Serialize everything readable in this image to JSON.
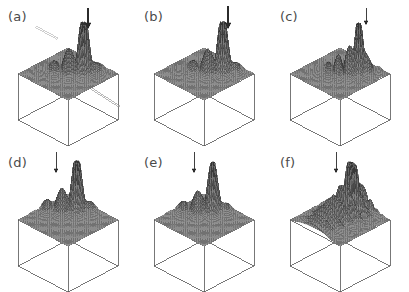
{
  "figure": {
    "type": "multi-panel-3d-surface-figure",
    "panel_count": 6,
    "grid_rows": 2,
    "grid_cols": 3,
    "background_color": "#ffffff",
    "surface_fill_color": "#7a7a7a",
    "surface_line_color": "#3a3a3a",
    "box_line_color": "#555555",
    "label_color": "#4a4a4a",
    "arrow_color": "#2b2b2b",
    "projection": "isometric",
    "base_shape": "diamond-square"
  },
  "panels": [
    {
      "id": "a",
      "label": "(a)",
      "arrow": {
        "present": true,
        "x": 88,
        "y": 8,
        "length": 20,
        "weight": "bold",
        "points": "down"
      },
      "extra_annotations": [
        {
          "name": "upper-left-pointer",
          "style": "thin-double-line",
          "color": "#b9b9b9",
          "x1": 36,
          "y1": 26,
          "x2": 58,
          "y2": 38
        },
        {
          "name": "lower-right-pointer",
          "style": "thin-double-line",
          "color": "#9a9a9a",
          "x1": 92,
          "y1": 88,
          "x2": 120,
          "y2": 106
        }
      ],
      "peak_height": 0.95,
      "peak_u": 0.62,
      "peak_v": 0.3,
      "ridge_orientation": "diagonal",
      "lobe_count": 2,
      "description": "tall narrow spike at rear with broad oscillatory lobe extending forward-left"
    },
    {
      "id": "b",
      "label": "(b)",
      "arrow": {
        "present": true,
        "x": 92,
        "y": 6,
        "length": 22,
        "weight": "bold",
        "points": "down"
      },
      "extra_annotations": [],
      "peak_height": 0.92,
      "peak_u": 0.64,
      "peak_v": 0.26,
      "ridge_orientation": "diagonal",
      "lobe_count": 2,
      "description": "narrow spike at rear, single elongated ridge sloping to front-left"
    },
    {
      "id": "c",
      "label": "(c)",
      "arrow": {
        "present": true,
        "x": 94,
        "y": 8,
        "length": 16,
        "weight": "thin",
        "points": "down"
      },
      "extra_annotations": [],
      "peak_height": 0.88,
      "peak_u": 0.66,
      "peak_v": 0.28,
      "ridge_orientation": "diagonal",
      "lobe_count": 3,
      "description": "broader crest with several concentric oscillation bands spreading left"
    },
    {
      "id": "d",
      "label": "(d)",
      "arrow": {
        "present": true,
        "x": 56,
        "y": 6,
        "length": 20,
        "weight": "thin",
        "points": "down"
      },
      "extra_annotations": [],
      "peak_height": 0.9,
      "peak_u": 0.4,
      "peak_v": 0.22,
      "ridge_orientation": "diagonal",
      "lobe_count": 2,
      "description": "spike shifted to the left edge with ridge trailing toward front-centre"
    },
    {
      "id": "e",
      "label": "(e)",
      "arrow": {
        "present": true,
        "x": 58,
        "y": 6,
        "length": 20,
        "weight": "thin",
        "points": "down"
      },
      "extra_annotations": [],
      "peak_height": 0.82,
      "peak_u": 0.42,
      "peak_v": 0.24,
      "ridge_orientation": "diagonal",
      "lobe_count": 2,
      "description": "slimmer spike on the left with compact ridge running to the front"
    },
    {
      "id": "f",
      "label": "(f)",
      "arrow": {
        "present": true,
        "x": 64,
        "y": 6,
        "length": 20,
        "weight": "thin",
        "points": "down"
      },
      "extra_annotations": [],
      "peak_height": 0.86,
      "peak_u": 0.46,
      "peak_v": 0.22,
      "ridge_orientation": "radial",
      "lobe_count": 4,
      "description": "broad multi-lobed crest with wide oscillatory skirt filling the plateau"
    }
  ],
  "chart_data": {
    "type": "surface",
    "title": "",
    "xlabel": "",
    "ylabel": "",
    "zlabel": "",
    "panel_ids": [
      "a",
      "b",
      "c",
      "d",
      "e",
      "f"
    ],
    "panel_labels": [
      "(a)",
      "(b)",
      "(c)",
      "(d)",
      "(e)",
      "(f)"
    ],
    "grid_on": false,
    "legend": "none",
    "axis_ticks": "none",
    "series": [
      {
        "name": "(a)",
        "peak_height": 0.95,
        "peak_u": 0.62,
        "peak_v": 0.3,
        "lobes": 2,
        "spread": 0.42
      },
      {
        "name": "(b)",
        "peak_height": 0.92,
        "peak_u": 0.64,
        "peak_v": 0.26,
        "lobes": 2,
        "spread": 0.4
      },
      {
        "name": "(c)",
        "peak_height": 0.88,
        "peak_u": 0.66,
        "peak_v": 0.28,
        "lobes": 3,
        "spread": 0.52
      },
      {
        "name": "(d)",
        "peak_height": 0.9,
        "peak_u": 0.4,
        "peak_v": 0.22,
        "lobes": 2,
        "spread": 0.38
      },
      {
        "name": "(e)",
        "peak_height": 0.82,
        "peak_u": 0.42,
        "peak_v": 0.24,
        "lobes": 2,
        "spread": 0.34
      },
      {
        "name": "(f)",
        "peak_height": 0.86,
        "peak_u": 0.46,
        "peak_v": 0.22,
        "lobes": 4,
        "spread": 0.58
      }
    ],
    "zlim": [
      0,
      1
    ]
  }
}
